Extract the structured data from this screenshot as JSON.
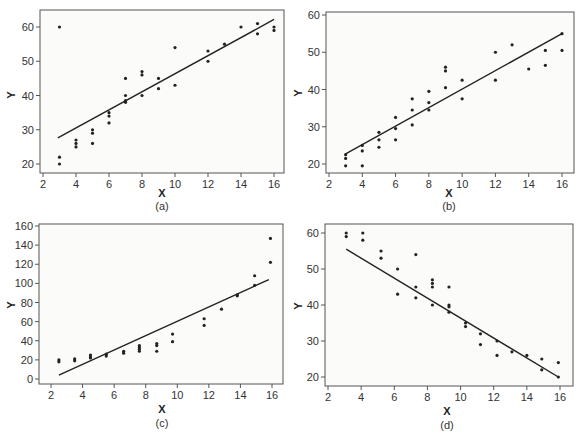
{
  "figure": {
    "panels": [
      "a",
      "b",
      "c",
      "d"
    ]
  },
  "chart_data": [
    {
      "id": "a",
      "type": "scatter",
      "caption": "(a)",
      "title": "",
      "xlabel": "X",
      "ylabel": "Y",
      "xlim": [
        1.8,
        16.6
      ],
      "ylim": [
        17.5,
        65
      ],
      "xticks": [
        2,
        4,
        6,
        8,
        10,
        12,
        14,
        16
      ],
      "yticks": [
        20,
        30,
        40,
        50,
        60
      ],
      "grid": false,
      "points": [
        [
          3,
          60
        ],
        [
          3,
          22
        ],
        [
          3,
          20
        ],
        [
          4,
          27
        ],
        [
          4,
          26
        ],
        [
          4,
          25
        ],
        [
          5,
          30
        ],
        [
          5,
          29
        ],
        [
          5,
          26
        ],
        [
          6,
          35
        ],
        [
          6,
          34
        ],
        [
          6,
          32
        ],
        [
          7,
          45
        ],
        [
          7,
          40
        ],
        [
          7,
          38.5
        ],
        [
          7,
          38
        ],
        [
          8,
          47
        ],
        [
          8,
          46
        ],
        [
          8,
          40
        ],
        [
          9,
          45
        ],
        [
          9,
          42
        ],
        [
          10,
          54
        ],
        [
          10,
          43
        ],
        [
          12,
          53
        ],
        [
          12,
          50
        ],
        [
          13,
          55
        ],
        [
          14,
          60
        ],
        [
          15,
          61
        ],
        [
          15,
          58
        ],
        [
          16,
          60
        ],
        [
          16,
          59
        ]
      ],
      "fit_line": [
        [
          2.9,
          27.6
        ],
        [
          16,
          62.2
        ]
      ],
      "geometry": {
        "frame": [
          40,
          10,
          284,
          173
        ],
        "x_px": [
          43,
          274
        ],
        "x_val": [
          2,
          16
        ],
        "y_px": [
          164,
          27
        ],
        "y_val": [
          20,
          60
        ],
        "caption_xy": [
          162,
          210
        ],
        "xlabel_xy": [
          162,
          197
        ],
        "ylabel_xy": [
          11,
          95
        ]
      }
    },
    {
      "id": "b",
      "type": "scatter",
      "caption": "(b)",
      "title": "",
      "xlabel": "X",
      "ylabel": "Y",
      "xlim": [
        1.8,
        16.7
      ],
      "ylim": [
        17.5,
        60.8
      ],
      "xticks": [
        2,
        4,
        6,
        8,
        10,
        12,
        14,
        16
      ],
      "yticks": [
        20,
        30,
        40,
        50,
        60
      ],
      "grid": false,
      "points": [
        [
          3,
          22.5
        ],
        [
          3,
          21.5
        ],
        [
          3,
          19.5
        ],
        [
          4,
          25
        ],
        [
          4,
          23.5
        ],
        [
          4,
          19.5
        ],
        [
          5,
          28.5
        ],
        [
          5,
          26.5
        ],
        [
          5,
          24.5
        ],
        [
          6,
          32.5
        ],
        [
          6,
          29.5
        ],
        [
          6,
          26.5
        ],
        [
          7,
          37.5
        ],
        [
          7,
          34.5
        ],
        [
          7,
          30.5
        ],
        [
          8,
          39.5
        ],
        [
          8,
          36.5
        ],
        [
          8,
          34.5
        ],
        [
          9,
          46
        ],
        [
          9,
          45
        ],
        [
          9,
          40.5
        ],
        [
          10,
          42.5
        ],
        [
          10,
          37.5
        ],
        [
          12,
          50
        ],
        [
          12,
          42.5
        ],
        [
          13,
          52
        ],
        [
          14,
          45.5
        ],
        [
          15,
          50.5
        ],
        [
          15,
          46.5
        ],
        [
          16,
          55
        ],
        [
          16,
          50.5
        ]
      ],
      "fit_line": [
        [
          3,
          22.7
        ],
        [
          16,
          55
        ]
      ],
      "geometry": {
        "frame": [
          326,
          12,
          574,
          173
        ],
        "x_px": [
          329,
          562
        ],
        "x_val": [
          2,
          16
        ],
        "y_px": [
          164,
          15
        ],
        "y_val": [
          20,
          60
        ],
        "caption_xy": [
          449,
          210
        ],
        "xlabel_xy": [
          449,
          197
        ],
        "ylabel_xy": [
          298,
          93
        ]
      }
    },
    {
      "id": "c",
      "type": "scatter",
      "caption": "(c)",
      "title": "",
      "xlabel": "X",
      "ylabel": "Y",
      "xlim": [
        1.3,
        16.7
      ],
      "ylim": [
        -5,
        162
      ],
      "xticks": [
        2,
        4,
        6,
        8,
        10,
        12,
        14,
        16
      ],
      "yticks": [
        0,
        20,
        40,
        60,
        80,
        100,
        120,
        140,
        160
      ],
      "grid": false,
      "points": [
        [
          2.5,
          20
        ],
        [
          2.5,
          18
        ],
        [
          3.5,
          21
        ],
        [
          3.5,
          19
        ],
        [
          4.5,
          25
        ],
        [
          4.5,
          23
        ],
        [
          4.5,
          22
        ],
        [
          5.5,
          26
        ],
        [
          5.5,
          24
        ],
        [
          6.6,
          29
        ],
        [
          6.6,
          27
        ],
        [
          7.6,
          35
        ],
        [
          7.6,
          33
        ],
        [
          7.6,
          31
        ],
        [
          7.6,
          29
        ],
        [
          8.7,
          37
        ],
        [
          8.7,
          35
        ],
        [
          8.7,
          29
        ],
        [
          9.7,
          47
        ],
        [
          9.7,
          39
        ],
        [
          11.7,
          63
        ],
        [
          11.7,
          56
        ],
        [
          12.8,
          73
        ],
        [
          13.8,
          88
        ],
        [
          13.8,
          87
        ],
        [
          14.9,
          108
        ],
        [
          14.9,
          98
        ],
        [
          15.9,
          147
        ],
        [
          15.9,
          122
        ]
      ],
      "fit_line": [
        [
          2.5,
          4
        ],
        [
          15.8,
          104
        ]
      ],
      "geometry": {
        "frame": [
          39,
          224,
          283,
          384
        ],
        "x_px": [
          51,
          272
        ],
        "x_val": [
          2,
          16
        ],
        "y_px": [
          379,
          226
        ],
        "y_val": [
          0,
          160
        ],
        "caption_xy": [
          162,
          427
        ],
        "xlabel_xy": [
          162,
          413
        ],
        "ylabel_xy": [
          11,
          305
        ]
      }
    },
    {
      "id": "d",
      "type": "scatter",
      "caption": "(d)",
      "title": "",
      "xlabel": "X",
      "ylabel": "Y",
      "xlim": [
        1.8,
        16.8
      ],
      "ylim": [
        17.5,
        62.5
      ],
      "xticks": [
        2,
        4,
        6,
        8,
        10,
        12,
        14,
        16
      ],
      "yticks": [
        20,
        30,
        40,
        50,
        60
      ],
      "grid": false,
      "points": [
        [
          3.1,
          60
        ],
        [
          3.1,
          59
        ],
        [
          4.1,
          60
        ],
        [
          4.1,
          58
        ],
        [
          5.2,
          55
        ],
        [
          5.2,
          53
        ],
        [
          6.2,
          50
        ],
        [
          6.2,
          43
        ],
        [
          7.3,
          54
        ],
        [
          7.3,
          45
        ],
        [
          7.3,
          42
        ],
        [
          8.3,
          47
        ],
        [
          8.3,
          46
        ],
        [
          8.3,
          45
        ],
        [
          8.3,
          40
        ],
        [
          9.3,
          45
        ],
        [
          9.3,
          40
        ],
        [
          9.3,
          39.5
        ],
        [
          9.3,
          38
        ],
        [
          10.3,
          35
        ],
        [
          10.3,
          34
        ],
        [
          11.2,
          32
        ],
        [
          11.2,
          29
        ],
        [
          12.2,
          30
        ],
        [
          12.2,
          26
        ],
        [
          13.1,
          27
        ],
        [
          14,
          26
        ],
        [
          14.9,
          25
        ],
        [
          14.9,
          22
        ],
        [
          15.9,
          24
        ],
        [
          15.9,
          20
        ]
      ],
      "fit_line": [
        [
          3.1,
          55.5
        ],
        [
          15.9,
          20
        ]
      ],
      "geometry": {
        "frame": [
          325,
          224,
          573,
          386
        ],
        "x_px": [
          328,
          560
        ],
        "x_val": [
          2,
          16
        ],
        "y_px": [
          377,
          233
        ],
        "y_val": [
          20,
          60
        ],
        "caption_xy": [
          447,
          429
        ],
        "xlabel_xy": [
          447,
          415
        ],
        "ylabel_xy": [
          298,
          306
        ]
      }
    }
  ]
}
